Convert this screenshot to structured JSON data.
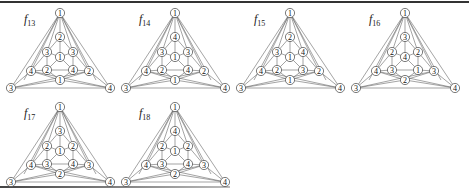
{
  "figure": {
    "panels": [
      {
        "id": "f13",
        "label_main": "f",
        "label_sub": "13",
        "x": 0,
        "y": 0,
        "nodes": {
          "top": "1",
          "inner_top": "2",
          "mid_left": "3",
          "center": "1",
          "mid_right": "3",
          "outer_left": "4",
          "low_left": "2",
          "low_right": "4",
          "outer_right": "2",
          "bottom": "1",
          "corner_left": "3",
          "corner_right": "4"
        }
      },
      {
        "id": "f14",
        "label_main": "f",
        "label_sub": "14",
        "x": 115,
        "y": 0,
        "nodes": {
          "top": "1",
          "inner_top": "4",
          "mid_left": "3",
          "center": "1",
          "mid_right": "3",
          "outer_left": "4",
          "low_left": "2",
          "low_right": "4",
          "outer_right": "2",
          "bottom": "1",
          "corner_left": "3",
          "corner_right": "4"
        }
      },
      {
        "id": "f15",
        "label_main": "f",
        "label_sub": "15",
        "x": 230,
        "y": 0,
        "nodes": {
          "top": "1",
          "inner_top": "2",
          "mid_left": "3",
          "center": "1",
          "mid_right": "4",
          "outer_left": "4",
          "low_left": "2",
          "low_right": "3",
          "outer_right": "2",
          "bottom": "1",
          "corner_left": "3",
          "corner_right": "4"
        }
      },
      {
        "id": "f16",
        "label_main": "f",
        "label_sub": "16",
        "x": 345,
        "y": 0,
        "nodes": {
          "top": "1",
          "inner_top": "3",
          "mid_left": "2",
          "center": "4",
          "mid_right": "2",
          "outer_left": "4",
          "low_left": "3",
          "low_right": "1",
          "outer_right": "3",
          "bottom": "2",
          "corner_left": "3",
          "corner_right": "4"
        }
      },
      {
        "id": "f17",
        "label_main": "f",
        "label_sub": "17",
        "x": 0,
        "y": 94,
        "nodes": {
          "top": "1",
          "inner_top": "3",
          "mid_left": "2",
          "center": "1",
          "mid_right": "2",
          "outer_left": "4",
          "low_left": "3",
          "low_right": "4",
          "outer_right": "3",
          "bottom": "2",
          "corner_left": "3",
          "corner_right": "4"
        }
      },
      {
        "id": "f18",
        "label_main": "f",
        "label_sub": "18",
        "x": 115,
        "y": 94,
        "nodes": {
          "top": "1",
          "inner_top": "4",
          "mid_left": "2",
          "center": "1",
          "mid_right": "2",
          "outer_left": "4",
          "low_left": "3",
          "low_right": "4",
          "outer_right": "3",
          "bottom": "2",
          "corner_left": "3",
          "corner_right": "4"
        }
      }
    ]
  }
}
